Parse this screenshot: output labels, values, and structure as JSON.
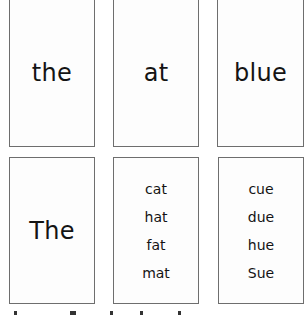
{
  "cards": [
    {
      "word": "the"
    },
    {
      "word": "at"
    },
    {
      "word": "blue"
    },
    {
      "word": "The"
    },
    {
      "words": [
        "cat",
        "hat",
        "fat",
        "mat"
      ]
    },
    {
      "words": [
        "cue",
        "due",
        "hue",
        "Sue"
      ]
    }
  ]
}
